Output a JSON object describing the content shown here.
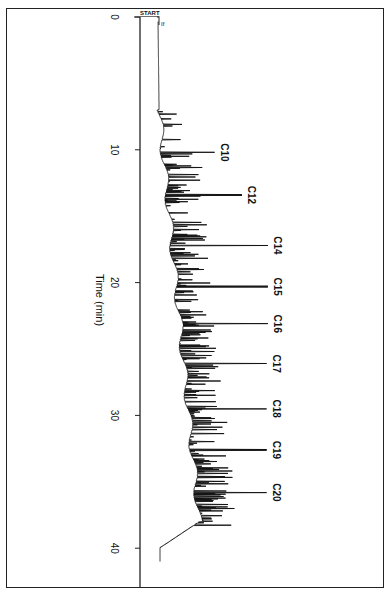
{
  "chart_data": {
    "type": "line",
    "title": "",
    "orientation": "rotated-90 (time axis vertical, top to bottom)",
    "xlabel": "Time (min)",
    "ylabel": "",
    "xlim": [
      0,
      41
    ],
    "x_ticks": [
      0,
      10,
      20,
      30,
      40
    ],
    "x_tick_labels": [
      "0",
      "10",
      "20",
      "30",
      "40"
    ],
    "grid": false,
    "legend": null,
    "annotations": [
      {
        "text": "START",
        "time": 0
      },
      {
        "text": "If",
        "time": 0.3
      }
    ],
    "series": [
      {
        "name": "chromatogram",
        "labeled_peaks": [
          {
            "label": "C10",
            "time": 10.2,
            "relative_height": 0.42
          },
          {
            "label": "C12",
            "time": 13.4,
            "relative_height": 0.63
          },
          {
            "label": "C14",
            "time": 17.2,
            "relative_height": 0.83
          },
          {
            "label": "C15",
            "time": 20.3,
            "relative_height": 0.83
          },
          {
            "label": "C16",
            "time": 23.1,
            "relative_height": 0.83
          },
          {
            "label": "C17",
            "time": 26.1,
            "relative_height": 0.82
          },
          {
            "label": "C18",
            "time": 29.5,
            "relative_height": 0.82
          },
          {
            "label": "C19",
            "time": 32.6,
            "relative_height": 0.82
          },
          {
            "label": "C20",
            "time": 35.8,
            "relative_height": 0.82
          }
        ],
        "baseline": {
          "start_time": 0,
          "end_time": 41,
          "description": "flat until ~7 min, dense unresolved hump of peaks from ~10 to ~38 min, baseline returns by ~40 min"
        }
      }
    ]
  },
  "labels": {
    "axis_title": "Time (min)",
    "start": "START",
    "inject": "If",
    "ticks": [
      "0",
      "10",
      "20",
      "30",
      "40"
    ],
    "peaks": [
      "C10",
      "C12",
      "C14",
      "C15",
      "C16",
      "C17",
      "C18",
      "C19",
      "C20"
    ]
  }
}
